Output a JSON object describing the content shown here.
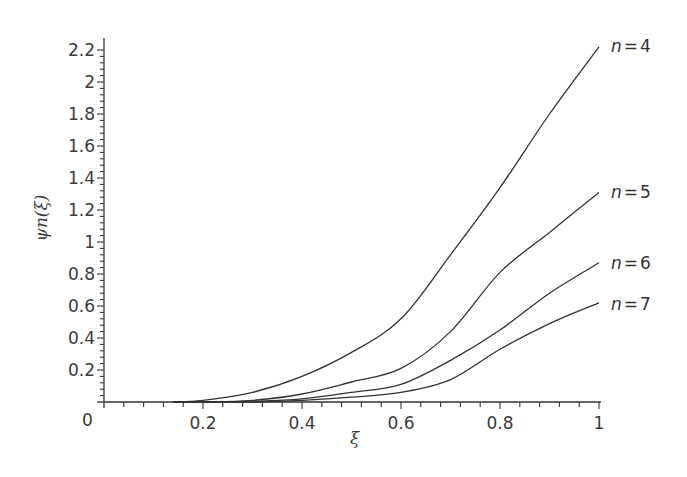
{
  "chart_data": {
    "type": "line",
    "title": "",
    "xlabel": "ξ",
    "ylabel": "ψn(ξ)",
    "xlim": [
      0,
      1
    ],
    "ylim": [
      0,
      2.2
    ],
    "grid": false,
    "legend_position": "inline-right",
    "x_ticks": [
      0.2,
      0.4,
      0.6,
      0.8,
      1
    ],
    "x_tick_labels": [
      "0.2",
      "0.4",
      "0.6",
      "0.8",
      "1"
    ],
    "y_ticks": [
      0.2,
      0.4,
      0.6,
      0.8,
      1,
      1.2,
      1.4,
      1.6,
      1.8,
      2,
      2.2
    ],
    "y_tick_labels": [
      "0.2",
      "0.4",
      "0.6",
      "0.8",
      "1",
      "1.2",
      "1.4",
      "1.6",
      "1.8",
      "2",
      "2.2"
    ],
    "origin_label": "0",
    "x": [
      0.14,
      0.2,
      0.3,
      0.4,
      0.5,
      0.6,
      0.7,
      0.8,
      0.9,
      1.0
    ],
    "series": [
      {
        "name": "n = 4",
        "label_n": "n",
        "label_eq": "=",
        "label_val": "4",
        "values": [
          0.0,
          0.01,
          0.06,
          0.16,
          0.31,
          0.52,
          0.92,
          1.34,
          1.8,
          2.22
        ]
      },
      {
        "name": "n = 5",
        "label_n": "n",
        "label_eq": "=",
        "label_val": "5",
        "values": [
          0.0,
          0.0,
          0.01,
          0.05,
          0.125,
          0.21,
          0.44,
          0.81,
          1.06,
          1.31
        ]
      },
      {
        "name": "n = 6",
        "label_n": "n",
        "label_eq": "=",
        "label_val": "6",
        "values": [
          0.0,
          0.0,
          0.005,
          0.02,
          0.06,
          0.11,
          0.26,
          0.45,
          0.68,
          0.87
        ]
      },
      {
        "name": "n = 7",
        "label_n": "n",
        "label_eq": "=",
        "label_val": "7",
        "values": [
          0.0,
          0.0,
          0.0,
          0.01,
          0.03,
          0.06,
          0.14,
          0.33,
          0.49,
          0.62
        ]
      }
    ],
    "line_color": "#333333",
    "axis_color": "#333333"
  }
}
